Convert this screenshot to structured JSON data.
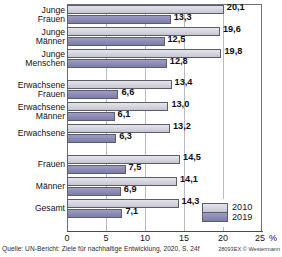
{
  "chart_data": {
    "type": "bar",
    "orientation": "horizontal",
    "title": "",
    "subtitle": "",
    "xlabel": "25 %",
    "ylabel": "",
    "xlim": [
      0,
      25
    ],
    "xticks": [
      0,
      5,
      10,
      15,
      20,
      25
    ],
    "xtick_labels": [
      "0",
      "5",
      "10",
      "15",
      "20",
      "25"
    ],
    "unit": "%",
    "grid": true,
    "legend_position": "bottom-right",
    "categories": [
      "Junge Frauen",
      "Junge Männer",
      "Junge Menschen",
      "Erwachsene Frauen",
      "Erwachsene Männer",
      "Erwachsene",
      "Frauen",
      "Männer",
      "Gesamt"
    ],
    "category_lines": [
      [
        "Junge",
        "Frauen"
      ],
      [
        "Junge",
        "Männer"
      ],
      [
        "Junge",
        "Menschen"
      ],
      [
        "Erwachsene",
        "Frauen"
      ],
      [
        "Erwachsene",
        "Männer"
      ],
      [
        "Erwachsene"
      ],
      [
        "Frauen"
      ],
      [
        "Männer"
      ],
      [
        "Gesamt"
      ]
    ],
    "series": [
      {
        "name": "2010",
        "color": "#d4d4de",
        "values": [
          20.1,
          19.6,
          19.8,
          13.4,
          13.0,
          13.2,
          14.5,
          14.1,
          14.3
        ],
        "labels": [
          "20,1",
          "19,6",
          "19,8",
          "13,4",
          "13,0",
          "13,2",
          "14,5",
          "14,1",
          "14,3"
        ]
      },
      {
        "name": "2019",
        "color": "#8a8ab4",
        "values": [
          13.3,
          12.5,
          12.8,
          6.6,
          6.1,
          6.3,
          7.5,
          6.9,
          7.1
        ],
        "labels": [
          "13,3",
          "12,5",
          "12,8",
          "6,6",
          "6,1",
          "6,3",
          "7,5",
          "6,9",
          "7,1"
        ]
      }
    ],
    "legend": [
      {
        "label": "2010",
        "color": "#d4d4de"
      },
      {
        "label": "2019",
        "color": "#8a8ab4"
      }
    ]
  },
  "footer": {
    "source": "Quelle: UN-Bericht: Ziele für nachhaltige Entwicklung, 2020, S. 24f",
    "credit": "28093EX © Westermann"
  }
}
